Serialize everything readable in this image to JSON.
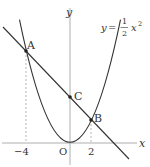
{
  "diagram": {
    "curve_label": {
      "lhs": "y",
      "eq": "=",
      "num": "1",
      "den": "2",
      "var": "x",
      "exp": "2"
    },
    "axes": {
      "x_label": "x",
      "y_label": "y",
      "origin_label": "O"
    },
    "ticks": {
      "neg4": "−4",
      "pos2": "2"
    },
    "points": {
      "A": "A",
      "B": "B",
      "C": "C"
    },
    "colors": {
      "stroke": "#333333",
      "guide": "#999999"
    }
  }
}
